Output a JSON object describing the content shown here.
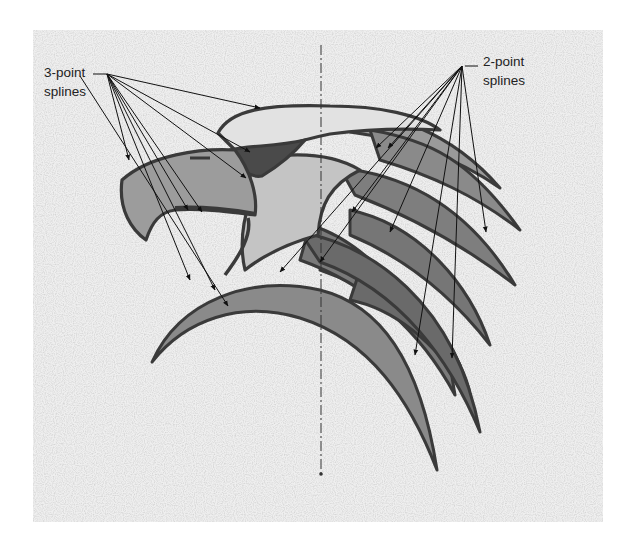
{
  "figure": {
    "background_color": "#efefef",
    "outline_color": "#3a3a3a",
    "fill_light": "#b5b5b5",
    "fill_mid": "#8e8e8e",
    "fill_dark": "#5e5e5e",
    "leader_color": "#111111"
  },
  "annotations": {
    "three_point": {
      "line1": "3-point",
      "line2": "splines",
      "leader_count": 9
    },
    "two_point": {
      "line1": "2-point",
      "line2": "splines",
      "leader_count": 9
    }
  },
  "centerline": {
    "style": "dash-dot",
    "x": 321,
    "y_top": 45,
    "y_bottom": 475
  }
}
